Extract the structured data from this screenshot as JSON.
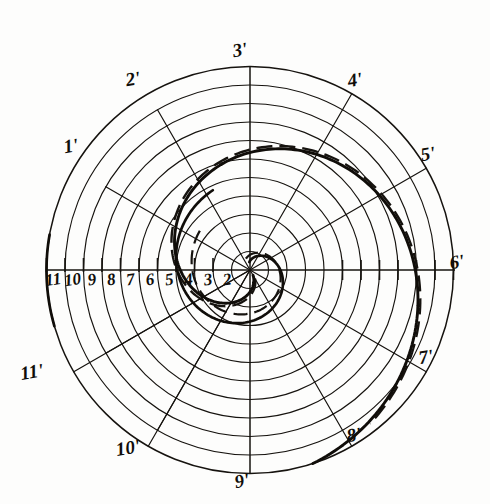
{
  "figure": {
    "width": 490,
    "height": 504,
    "background_color": "#fdfdfc",
    "ink_color": "#16130f"
  },
  "geometry": {
    "center_x": 250,
    "center_y": 270,
    "ring_count": 11,
    "ring_step": 18.5,
    "outer_radius": 203.5,
    "radial_count": 12,
    "angle_step_deg": 30
  },
  "chart_data": {
    "type": "line",
    "xlabel": "",
    "ylabel": "",
    "polar": true,
    "grid": true,
    "legend": "none",
    "radial_divisions": 12,
    "concentric_rings": 11,
    "ring_radii": [
      18.5,
      37,
      55.5,
      74,
      92.5,
      111,
      129.5,
      148,
      166.5,
      185,
      203.5
    ],
    "angle_labels_deg": [
      180,
      150,
      120,
      90,
      60,
      30,
      0,
      330,
      300,
      270,
      240,
      210
    ],
    "series": [
      {
        "name": "spiral-solid",
        "description": "Archimedean spiral r = a*theta, solid heavy line",
        "theta_deg": [
          0,
          30,
          60,
          90,
          120,
          150,
          180,
          210,
          240,
          270,
          300,
          330,
          360
        ],
        "r": [
          0,
          18.5,
          37,
          55.5,
          74,
          92.5,
          111,
          129.5,
          148,
          166.5,
          185,
          203.5,
          203.5
        ]
      },
      {
        "name": "spiral-dashed",
        "description": "Offset companion spiral, dashed heavy line",
        "theta_deg": [
          0,
          30,
          60,
          90,
          120,
          150,
          180,
          210,
          240,
          270,
          300,
          330
        ],
        "r": [
          0,
          16,
          33,
          51,
          69,
          87,
          105,
          123,
          141,
          159,
          177,
          195
        ]
      }
    ]
  },
  "radial_labels": [
    {
      "id": "1",
      "text": "1'",
      "x": 72,
      "y": 152
    },
    {
      "id": "2",
      "text": "2'",
      "x": 134,
      "y": 85
    },
    {
      "id": "3",
      "text": "3'",
      "x": 241,
      "y": 56
    },
    {
      "id": "4",
      "text": "4'",
      "x": 356,
      "y": 86
    },
    {
      "id": "5",
      "text": "5'",
      "x": 429,
      "y": 160
    },
    {
      "id": "6",
      "text": "6'",
      "x": 458,
      "y": 268
    },
    {
      "id": "7",
      "text": "7'",
      "x": 427,
      "y": 363
    },
    {
      "id": "8",
      "text": "8'",
      "x": 355,
      "y": 441
    },
    {
      "id": "9",
      "text": "9'",
      "x": 243,
      "y": 487
    },
    {
      "id": "10",
      "text": "10'",
      "x": 129,
      "y": 454
    },
    {
      "id": "11",
      "text": "11'",
      "x": 33,
      "y": 378
    }
  ],
  "axis_tick_labels": {
    "description": "Radial station numbers along the left horizontal axis, read outward from centre",
    "values": [
      "11",
      "10",
      "9",
      "8",
      "7",
      "6",
      "5",
      "4",
      "3",
      "2"
    ],
    "joined": "11 10 9 8 7 6 5 4 3 2",
    "baseline_y": 285,
    "start_x": 54,
    "end_x": 228
  }
}
